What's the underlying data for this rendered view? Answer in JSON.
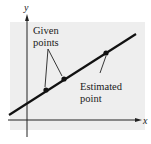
{
  "diagram": {
    "type": "line-with-points",
    "axes": {
      "x_label": "x",
      "y_label": "y"
    },
    "annotations": {
      "given_line1": "Given",
      "given_line2": "points",
      "estimated_line1": "Estimated",
      "estimated_line2": "point"
    },
    "colors": {
      "background_panel": "#eeeeee",
      "line": "#111111",
      "axis": "#222222"
    },
    "points": [
      {
        "role": "given",
        "x": 46,
        "y": 90
      },
      {
        "role": "given",
        "x": 64,
        "y": 79
      },
      {
        "role": "estimated",
        "x": 106,
        "y": 53
      }
    ]
  }
}
